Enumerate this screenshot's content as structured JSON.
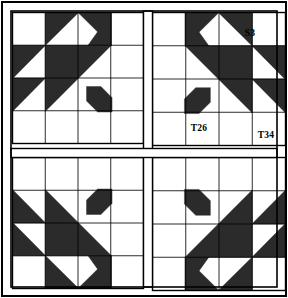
{
  "figure": {
    "kind": "quilt-block-diagram",
    "width": 288,
    "height": 298,
    "background_color": "#ffffff",
    "patch_dark_color": "#2b2b2b",
    "patch_light_color": "#ffffff",
    "line_color": "#000000"
  },
  "frame": {
    "outer_border": {
      "x": 2,
      "y": 2,
      "width": 284,
      "height": 294,
      "stroke_width": 2
    },
    "inner_border": {
      "x": 11,
      "y": 11,
      "width": 266,
      "height": 276,
      "stroke_width": 1.6
    }
  },
  "sashing": {
    "vertical": {
      "x": 143.5,
      "y": 11,
      "width": 9,
      "height": 276
    },
    "horizontal": {
      "x": 11,
      "y": 148.5,
      "width": 266,
      "height": 9
    }
  },
  "blocks": [
    {
      "name": "block-top-left",
      "position": "top-left",
      "x": 12.5,
      "y": 12.5,
      "size": 131,
      "flip_x": false,
      "flip_y": false
    },
    {
      "name": "block-top-right",
      "position": "top-right",
      "x": 152.5,
      "y": 12.5,
      "size": 133,
      "flip_x": true,
      "flip_y": false
    },
    {
      "name": "block-bottom-left",
      "position": "bottom-left",
      "x": 12.5,
      "y": 157.5,
      "size": 131,
      "flip_x": false,
      "flip_y": true
    },
    {
      "name": "block-bottom-right",
      "position": "bottom-right",
      "x": 152.5,
      "y": 157.5,
      "size": 133,
      "flip_x": true,
      "flip_y": true
    }
  ],
  "block_template": {
    "description": "Maple Leaf / Bear's Paw block drawn on a 4x4 unit grid, unit = size/4",
    "grid_units": 4,
    "patches": [
      {
        "name": "corner-square-plain",
        "type": "square",
        "fill": "light",
        "cells": [
          0,
          0
        ]
      },
      {
        "name": "half-square-triangle-r0c1",
        "type": "triangle",
        "fill": "dark",
        "cells": [
          1,
          0
        ],
        "corners": "tl-tr-bl"
      },
      {
        "name": "half-square-triangle-r0c2",
        "type": "triangle",
        "fill": "dark",
        "cells": [
          2,
          0
        ],
        "corners": "tr-br-tl"
      },
      {
        "name": "flying-geese-top-right",
        "type": "triangle",
        "fill": "dark",
        "cells": [
          3,
          0
        ],
        "corners": "tl-bl-br"
      },
      {
        "name": "half-square-triangle-r1c0",
        "type": "triangle",
        "fill": "dark",
        "cells": [
          0,
          1
        ],
        "corners": "tl-tr-bl"
      },
      {
        "name": "leaf-big-triangle",
        "type": "triangle",
        "fill": "dark",
        "cells": [
          1,
          1
        ],
        "corners": "big"
      },
      {
        "name": "half-square-triangle-r2c0",
        "type": "triangle",
        "fill": "dark",
        "cells": [
          0,
          2
        ],
        "corners": "tl-tr-bl"
      },
      {
        "name": "leaf-stem",
        "type": "band",
        "fill": "dark",
        "cells": [
          2,
          2
        ]
      },
      {
        "name": "corner-square-plain-bottom",
        "type": "square",
        "fill": "light",
        "cells": [
          0,
          3
        ]
      }
    ]
  },
  "labels": [
    {
      "id": "label-s3",
      "text": "S3",
      "x": 250.0,
      "y": 36.0,
      "anchor": "middle",
      "block": "top-right",
      "patch": "corner-square-plain"
    },
    {
      "id": "label-t26",
      "text": "T26",
      "x": 199.0,
      "y": 131.0,
      "anchor": "middle",
      "block": "top-right",
      "patch": "leaf-stem-area"
    },
    {
      "id": "label-t34",
      "text": "T34",
      "x": 266.0,
      "y": 138.0,
      "anchor": "middle",
      "block": "top-right",
      "patch": "flying-geese-lower"
    }
  ]
}
